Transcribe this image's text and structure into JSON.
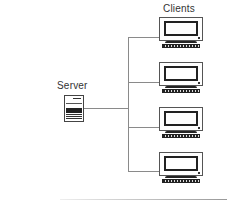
{
  "diagram": {
    "type": "client-server network",
    "server": {
      "label": "Server",
      "icon": "server-icon"
    },
    "clients": {
      "label": "Clients",
      "items": [
        {
          "icon": "computer-icon"
        },
        {
          "icon": "computer-icon"
        },
        {
          "icon": "computer-icon"
        },
        {
          "icon": "computer-icon"
        }
      ]
    },
    "connections": [
      {
        "from": "Server",
        "to": "Client 1"
      },
      {
        "from": "Server",
        "to": "Client 2"
      },
      {
        "from": "Server",
        "to": "Client 3"
      },
      {
        "from": "Server",
        "to": "Client 4"
      }
    ],
    "colors": {
      "line": "#8a8a8a",
      "device_outline": "#444444",
      "background": "#ffffff"
    }
  }
}
